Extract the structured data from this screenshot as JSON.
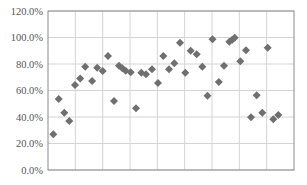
{
  "chart_data": {
    "type": "scatter",
    "title": "",
    "xlabel": "",
    "ylabel": "",
    "ylim": [
      0,
      120
    ],
    "yticks": [
      "0.0%",
      "20.0%",
      "40.0%",
      "60.0%",
      "80.0%",
      "100.0%",
      "120.0%"
    ],
    "ytick_values": [
      0,
      20,
      40,
      60,
      80,
      100,
      120
    ],
    "x_gridlines": 9,
    "grid": true,
    "legend": null,
    "marker": "diamond",
    "colors": {
      "marker": "#6f6f6f",
      "grid": "#d4d4d4",
      "border": "#8a8a8a",
      "tick_text": "#555555"
    },
    "series": [
      {
        "name": "Series 1",
        "x": [
          53.3,
          58.7,
          64.3,
          69.3,
          75.0,
          80.2,
          85.2,
          92.1,
          97.2,
          102.7,
          108.0,
          114.0,
          119.0,
          122.3,
          125.7,
          130.7,
          136.0,
          141.3,
          146.0,
          152.0,
          158.0,
          163.3,
          169.0,
          174.3,
          180.0,
          185.3,
          190.7,
          196.7,
          202.3,
          207.5,
          212.5,
          218.8,
          224.0,
          229.3,
          232.3,
          234.7,
          240.3,
          246.0,
          251.0,
          256.7,
          262.3,
          267.7,
          273.3,
          278.3
        ],
        "values": [
          26.9,
          53.6,
          43.2,
          37.0,
          64.2,
          69.1,
          78.0,
          67.2,
          77.2,
          74.7,
          86.0,
          52.1,
          78.7,
          76.8,
          74.9,
          73.7,
          46.6,
          73.4,
          72.2,
          76.0,
          65.7,
          86.0,
          76.0,
          80.5,
          96.1,
          73.4,
          90.0,
          87.3,
          78.0,
          56.1,
          98.7,
          66.4,
          78.7,
          96.8,
          98.3,
          99.8,
          82.0,
          90.3,
          39.8,
          56.4,
          43.2,
          92.3,
          38.3,
          41.5
        ]
      }
    ]
  }
}
